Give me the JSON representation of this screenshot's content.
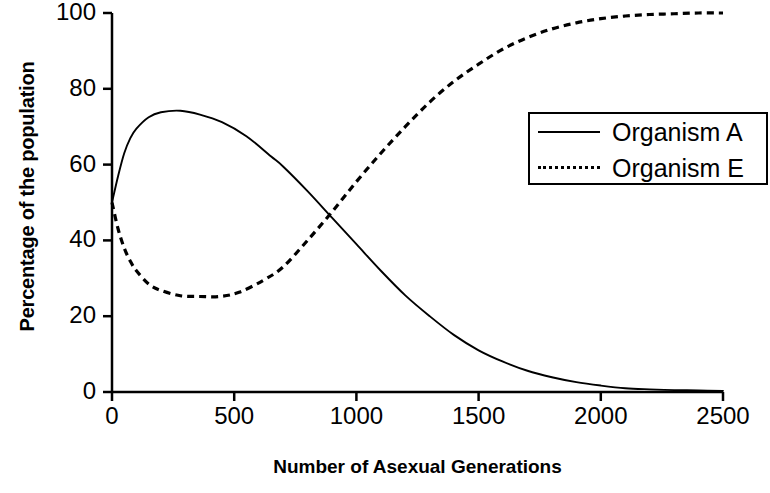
{
  "chart_data": {
    "type": "line",
    "title": "",
    "xlabel": "Number of Asexual Generations",
    "ylabel": "Percentage of the population",
    "xlim": [
      0,
      2500
    ],
    "ylim": [
      0,
      100
    ],
    "xticks": [
      0,
      500,
      1000,
      1500,
      2000,
      2500
    ],
    "yticks": [
      0,
      20,
      40,
      60,
      80,
      100
    ],
    "xtick_labels": [
      "0",
      "500",
      "1000",
      "1500",
      "2000",
      "2500"
    ],
    "ytick_labels": [
      "0",
      "20",
      "40",
      "60",
      "80",
      "100"
    ],
    "grid": false,
    "legend_position": "upper right",
    "series": [
      {
        "name": "Organism A",
        "style": "solid",
        "color": "#000000",
        "x": [
          0,
          25,
          50,
          75,
          100,
          150,
          200,
          280,
          360,
          450,
          550,
          650,
          700,
          800,
          900,
          1000,
          1100,
          1200,
          1300,
          1400,
          1500,
          1600,
          1700,
          1800,
          1900,
          2000,
          2100,
          2200,
          2300,
          2400,
          2500
        ],
        "y": [
          50,
          57,
          63,
          67,
          69.5,
          72.5,
          73.8,
          74.2,
          73.2,
          71.2,
          67.5,
          62.2,
          59.5,
          53,
          46,
          39,
          32,
          25.5,
          20,
          15,
          11,
          8,
          5.6,
          3.9,
          2.6,
          1.7,
          1.0,
          0.7,
          0.5,
          0.4,
          0.3
        ]
      },
      {
        "name": "Organism E",
        "style": "dotted",
        "color": "#000000",
        "x": [
          0,
          25,
          50,
          75,
          100,
          150,
          200,
          280,
          360,
          440,
          520,
          620,
          700,
          800,
          900,
          1000,
          1100,
          1200,
          1300,
          1400,
          1500,
          1600,
          1700,
          1800,
          1900,
          2000,
          2100,
          2200,
          2300,
          2400,
          2500
        ],
        "y": [
          50,
          43,
          38,
          34.5,
          32,
          28.5,
          26.8,
          25.4,
          25.2,
          25.2,
          26.3,
          29.5,
          33,
          40,
          47.5,
          55.5,
          63,
          70,
          76.5,
          82,
          86.5,
          90.5,
          93.5,
          95.8,
          97.4,
          98.5,
          99.2,
          99.6,
          99.8,
          100,
          100
        ]
      }
    ],
    "crossover": {
      "x": 700,
      "y": 48
    }
  },
  "axis": {
    "y_title": "Percentage of the population",
    "x_title": "Number of Asexual Generations"
  },
  "legend": {
    "items": [
      {
        "label": "Organism A",
        "style": "solid"
      },
      {
        "label": "Organism E",
        "style": "dotted"
      }
    ]
  },
  "colors": {
    "axis": "#000000",
    "series_a": "#000000",
    "series_e": "#000000",
    "background": "#ffffff"
  }
}
